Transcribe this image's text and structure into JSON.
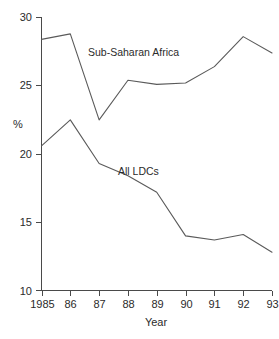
{
  "chart_data": {
    "type": "line",
    "title": "",
    "subtitle": "",
    "xlabel": "Year",
    "ylabel": "%",
    "categories": [
      "1985",
      "86",
      "87",
      "88",
      "89",
      "90",
      "91",
      "92",
      "93"
    ],
    "x": [
      1985,
      1986,
      1987,
      1988,
      1989,
      1990,
      1991,
      1992,
      1993
    ],
    "xlim": [
      1985,
      1993
    ],
    "ylim": [
      10,
      30
    ],
    "ytick_labels": [
      "30",
      "25",
      "20",
      "15",
      "10"
    ],
    "yticks": [
      30,
      25,
      20,
      15,
      10
    ],
    "grid": false,
    "legend_position": "inline-annotations",
    "series": [
      {
        "name": "Sub-Saharan Africa",
        "values": [
          28.4,
          28.8,
          22.5,
          25.4,
          25.1,
          25.2,
          26.4,
          28.6,
          27.4
        ],
        "color": "#5a5a5a"
      },
      {
        "name": "All LDCs",
        "values": [
          20.6,
          22.5,
          19.3,
          18.4,
          17.2,
          14.0,
          13.7,
          14.1,
          12.8
        ],
        "color": "#5a5a5a"
      }
    ],
    "annotations": [
      {
        "text": "Sub-Saharan Africa",
        "x": 88,
        "y": 52
      },
      {
        "text": "All LDCs",
        "x": 118,
        "y": 171
      }
    ]
  }
}
